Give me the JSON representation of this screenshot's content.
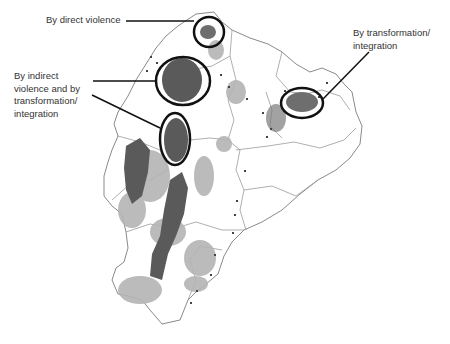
{
  "map": {
    "subject": "Ecuador",
    "colors": {
      "border": "#8a8a8a",
      "dark_area": "#5a5a5a",
      "light_area": "#b4b4b4",
      "circle": "#111111",
      "leader": "#111111"
    },
    "annotations": [
      {
        "id": "direct",
        "label": "By direct violence"
      },
      {
        "id": "indirect",
        "label": "By indirect\nviolence and by\ntransformation/\nintegration"
      },
      {
        "id": "transform",
        "label": "By transformation/\nintegration"
      }
    ]
  }
}
